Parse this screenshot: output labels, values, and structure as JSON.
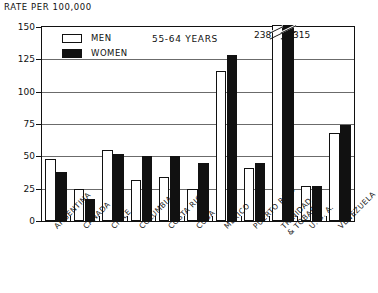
{
  "axis_title": "RATE PER 100,000",
  "plot_title": "55-64 YEARS",
  "legend": {
    "men_label": "MEN",
    "women_label": "WOMEN"
  },
  "colors": {
    "men": "#ffffff",
    "women": "#111111",
    "axis": "#111111",
    "grid": "#6b6b6b"
  },
  "chart_data": {
    "type": "bar",
    "title": "55-64 YEARS",
    "xlabel": "",
    "ylabel": "RATE PER 100,000",
    "ylim": [
      0,
      150
    ],
    "yticks": [
      0,
      25,
      50,
      75,
      100,
      125,
      150
    ],
    "grid": true,
    "legend_position": "top-left",
    "axis_break": true,
    "axis_break_note": "Trinidad & Tobago bars exceed the 150 axis maximum and are drawn broken with their values labelled above",
    "categories": [
      "ARGENTINA",
      "CANADA",
      "CHILE",
      "COLUMBIA",
      "COSTA RICA",
      "CUBA",
      "MEXICO",
      "PUERTO RICO",
      "TRINIDAD\n& TOBAGO",
      "U. S. A.",
      "VENEZUELA"
    ],
    "series": [
      {
        "name": "MEN",
        "values": [
          48,
          25,
          55,
          32,
          34,
          25,
          116,
          41,
          238,
          27,
          68
        ]
      },
      {
        "name": "WOMEN",
        "values": [
          38,
          17,
          52,
          50,
          50,
          45,
          128,
          45,
          315,
          27,
          74
        ]
      }
    ],
    "annotations": [
      {
        "text": "238",
        "category": "TRINIDAD\n& TOBAGO",
        "series": "MEN"
      },
      {
        "text": "315",
        "category": "TRINIDAD\n& TOBAGO",
        "series": "WOMEN"
      }
    ]
  }
}
